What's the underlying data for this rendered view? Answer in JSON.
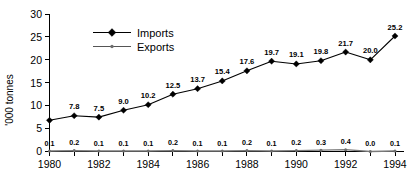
{
  "chart_data": {
    "type": "line",
    "title": "",
    "xlabel": "",
    "ylabel": "'000 tonnes",
    "x": [
      1980,
      1981,
      1982,
      1983,
      1984,
      1985,
      1986,
      1987,
      1988,
      1989,
      1990,
      1991,
      1992,
      1993,
      1994
    ],
    "xtick_labels": [
      "1980",
      "1982",
      "1984",
      "1986",
      "1988",
      "1990",
      "1992",
      "1994"
    ],
    "xtick_values": [
      1980,
      1982,
      1984,
      1986,
      1988,
      1990,
      1992,
      1994
    ],
    "xlim": [
      1980,
      1994
    ],
    "ylim": [
      0,
      30
    ],
    "ytick_labels": [
      "0",
      "5",
      "10",
      "15",
      "20",
      "25",
      "30"
    ],
    "ytick_values": [
      0,
      5,
      10,
      15,
      20,
      25,
      30
    ],
    "grid": false,
    "legend_position": "upper-left-inside",
    "series": [
      {
        "name": "Imports",
        "marker": "diamond",
        "color": "#000000",
        "values": [
          6.8,
          7.8,
          7.5,
          9.0,
          10.2,
          12.5,
          13.7,
          15.4,
          17.6,
          19.7,
          19.1,
          19.8,
          21.7,
          20.0,
          25.2
        ],
        "data_labels": [
          "",
          "7.8",
          "7.5",
          "9.0",
          "10.2",
          "12.5",
          "13.7",
          "15.4",
          "17.6",
          "19.7",
          "19.1",
          "19.8",
          "21.7",
          "20.0",
          "25.2"
        ]
      },
      {
        "name": "Exports",
        "marker": "dot",
        "color": "#6e6e6e",
        "values": [
          0.1,
          0.2,
          0.1,
          0.1,
          0.1,
          0.2,
          0.1,
          0.1,
          0.2,
          0.1,
          0.2,
          0.3,
          0.4,
          0.0,
          0.1
        ],
        "data_labels": [
          "0.1",
          "0.2",
          "0.1",
          "0.1",
          "0.1",
          "0.2",
          "0.1",
          "0.1",
          "0.2",
          "0.1",
          "0.2",
          "0.3",
          "0.4",
          "0.0",
          "0.1"
        ]
      }
    ]
  },
  "legend": {
    "items": [
      {
        "label": "Imports"
      },
      {
        "label": "Exports"
      }
    ]
  }
}
